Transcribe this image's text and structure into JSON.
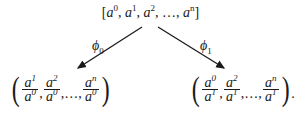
{
  "top": {
    "base": "a",
    "exps": [
      "0",
      "1",
      "2",
      "…",
      "n"
    ],
    "text": "[a⁰, a¹, a², …, aⁿ]"
  },
  "arrows": [
    {
      "label": "ϕ",
      "sub": "0"
    },
    {
      "label": "ϕ",
      "sub": "1"
    }
  ],
  "left_tuple": {
    "fracs": [
      {
        "num": "a",
        "num_exp": "1",
        "den": "a",
        "den_exp": "0"
      },
      {
        "num": "a",
        "num_exp": "2",
        "den": "a",
        "den_exp": "0"
      },
      {
        "num": "a",
        "num_exp": "n",
        "den": "a",
        "den_exp": "0"
      }
    ],
    "ellipsis": "…",
    "trailing": ""
  },
  "right_tuple": {
    "fracs": [
      {
        "num": "a",
        "num_exp": "0",
        "den": "a",
        "den_exp": "1"
      },
      {
        "num": "a",
        "num_exp": "2",
        "den": "a",
        "den_exp": "1"
      },
      {
        "num": "a",
        "num_exp": "n",
        "den": "a",
        "den_exp": "1"
      }
    ],
    "ellipsis": "…",
    "trailing": "."
  },
  "colors": {
    "ink": "#1a1a1a",
    "background": "#ffffff"
  }
}
